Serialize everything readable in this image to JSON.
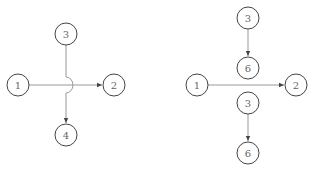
{
  "diagrams": [
    {
      "name": "left-diagram",
      "description": "Crossing edges with jump-over arc",
      "nodes": [
        {
          "id": "L1",
          "label": "1",
          "x": 18,
          "y": 85
        },
        {
          "id": "L2",
          "label": "2",
          "x": 114,
          "y": 85
        },
        {
          "id": "L3",
          "label": "3",
          "x": 66,
          "y": 34
        },
        {
          "id": "L4",
          "label": "4",
          "x": 66,
          "y": 135
        }
      ],
      "edges": [
        {
          "from": "1",
          "to": "2",
          "directed": true
        },
        {
          "from": "3",
          "to": "4",
          "directed": true,
          "jump_over": true
        }
      ]
    },
    {
      "name": "right-diagram",
      "description": "Node 3 split into two instances, each pointing to 6",
      "nodes": [
        {
          "id": "R3a",
          "label": "3",
          "x": 248,
          "y": 18
        },
        {
          "id": "R6a",
          "label": "6",
          "x": 248,
          "y": 68
        },
        {
          "id": "R1",
          "label": "1",
          "x": 197,
          "y": 85
        },
        {
          "id": "R2",
          "label": "2",
          "x": 296,
          "y": 85
        },
        {
          "id": "R3b",
          "label": "3",
          "x": 248,
          "y": 103
        },
        {
          "id": "R6b",
          "label": "6",
          "x": 248,
          "y": 153
        }
      ],
      "edges": [
        {
          "from": "3",
          "to": "6",
          "directed": true
        },
        {
          "from": "1",
          "to": "2",
          "directed": true
        },
        {
          "from": "3",
          "to": "6",
          "directed": true
        }
      ]
    }
  ],
  "colors": {
    "node_stroke": "#444444",
    "edge": "#999999",
    "label": "#666666"
  }
}
